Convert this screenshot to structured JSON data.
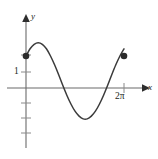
{
  "figure": {
    "name": "sinusoid-graph",
    "background_color": "#ffffff",
    "stroke_color": "#3b3b3b",
    "axis_color": "#6b6b6b",
    "text_color": "#231f20",
    "width": 158,
    "height": 159
  },
  "axes": {
    "y_axis_label": "y",
    "x_axis_label": "x",
    "y_axis_icon": "vertical-axis-arrow-icon",
    "x_axis_icon": "horizontal-axis-arrow-icon",
    "origin_px": {
      "x": 26,
      "y": 88
    },
    "y_ticks_px": [
      55,
      72,
      103,
      118,
      133
    ],
    "x_ticks_px": [
      124
    ]
  },
  "labels": {
    "y_value_one": "1",
    "x_value_two_pi": "2π",
    "x_value_two_pi_number": "2",
    "x_value_two_pi_symbol": "π"
  },
  "endpoints": {
    "left_point_px": {
      "x": 26,
      "y": 55
    },
    "right_point_px": {
      "x": 128,
      "y": 55
    },
    "marker_style": "filled-circle"
  },
  "chart_data": {
    "type": "line",
    "title": "",
    "xlabel": "x",
    "ylabel": "y",
    "xlim": [
      0,
      6.2832
    ],
    "ylim": [
      -3,
      3
    ],
    "x_tick_values": [
      6.2832
    ],
    "x_tick_labels": [
      "2π"
    ],
    "y_tick_values": [
      1
    ],
    "y_tick_labels": [
      "1"
    ],
    "grid": false,
    "legend": null,
    "annotations": [
      {
        "text": "1",
        "x": 0,
        "y": 1,
        "note": "y-axis tick label"
      },
      {
        "text": "2π",
        "x": 6.2832,
        "y": 0,
        "note": "x-axis tick label"
      }
    ],
    "markers": [
      {
        "x": 0,
        "y": 2,
        "style": "filled-circle"
      },
      {
        "x": 6.2832,
        "y": 2,
        "style": "filled-circle"
      }
    ],
    "series": [
      {
        "name": "curve",
        "x": [
          0.0,
          0.2618,
          0.5236,
          0.7854,
          1.0472,
          1.309,
          1.5708,
          1.8326,
          2.0944,
          2.3562,
          2.618,
          2.8798,
          3.1416,
          3.4034,
          3.6652,
          3.927,
          4.1888,
          4.4506,
          4.7124,
          4.9742,
          5.236,
          5.4978,
          5.7596,
          6.0214,
          6.2832
        ],
        "y": [
          2.0,
          2.45,
          2.73,
          2.83,
          2.73,
          2.45,
          2.0,
          1.45,
          0.83,
          0.17,
          -0.45,
          -1.0,
          -1.45,
          -1.76,
          -1.93,
          -1.93,
          -1.76,
          -1.45,
          -1.0,
          -0.45,
          0.17,
          0.83,
          1.45,
          2.0,
          2.45
        ]
      }
    ]
  }
}
